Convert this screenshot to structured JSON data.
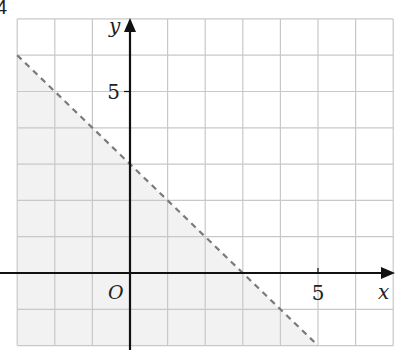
{
  "figure": {
    "corner_label": "4",
    "colors": {
      "grid": "#c8c8c8",
      "axis": "#111111",
      "boundary": "#7a7a7a",
      "shade": "#f2f2f2",
      "text": "#222222"
    }
  },
  "chart_data": {
    "type": "inequality-region",
    "title": "",
    "xlabel": "x",
    "ylabel": "y",
    "origin_label": "O",
    "xlim": [
      -3,
      7
    ],
    "ylim": [
      -2,
      7
    ],
    "grid": true,
    "grid_step": 1,
    "x_tick_labels": [
      {
        "value": 5,
        "label": "5"
      }
    ],
    "y_tick_labels": [
      {
        "value": 5,
        "label": "5"
      }
    ],
    "boundary_line": {
      "equation": "x + y = 3",
      "style": "dashed",
      "points": [
        [
          -3,
          6
        ],
        [
          5,
          -2
        ]
      ],
      "x_intercept": 3,
      "y_intercept": 3
    },
    "shaded_region": {
      "inequality": "x + y < 3",
      "side": "below-left of boundary"
    }
  }
}
